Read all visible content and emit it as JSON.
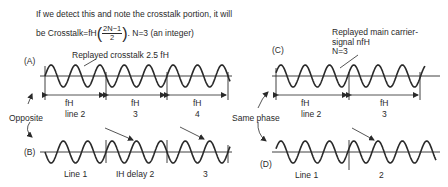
{
  "header": {
    "line1": "If we detect this and note the crosstalk portion, it will",
    "line2_prefix": "be Crosstalk=fH",
    "frac_num": "2N−1",
    "frac_den": "2",
    "line2_suffix": ". N=3 (an integer)"
  },
  "panels": {
    "A": {
      "label": "(A)",
      "title": "Replayed crosstalk 2.5 fH",
      "segments": [
        {
          "top": "fH",
          "bottom": "line 2"
        },
        {
          "top": "fH",
          "bottom": "3"
        },
        {
          "top": "fH",
          "bottom": "4"
        }
      ]
    },
    "B": {
      "label": "(B)",
      "segments": [
        "Line 1",
        "IH delay  2",
        "3"
      ]
    },
    "C": {
      "label": "(C)",
      "title_line1": "Replayed main carrier-",
      "title_line2": "signal nfH",
      "title_line3": "N=3",
      "segments": [
        {
          "top": "fH",
          "bottom": "line 2"
        },
        {
          "top": "fH",
          "bottom": "3"
        }
      ]
    },
    "D": {
      "label": "(D)",
      "segments": [
        "Line 1",
        "2"
      ]
    }
  },
  "annotations": {
    "left": "Opposite",
    "right": "Same phase"
  },
  "colors": {
    "ink": "#2a2a2a",
    "background": "#ffffff"
  }
}
